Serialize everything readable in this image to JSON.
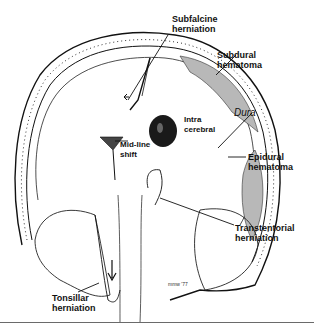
{
  "figure": {
    "labels": {
      "subfalcine": "Subfalcine\nherniation",
      "subdural": "Subdural\nhematoma",
      "dura": "Dura",
      "intracerebral": "Intra\ncerebral",
      "midline": "Mid-line\nshift",
      "epidural": "Epidural\nhematoma",
      "transtentorial": "Transtentorial\nherniation",
      "tonsillar": "Tonsillar\nherniation"
    },
    "artist_signature": "mmw '77"
  },
  "colors": {
    "ink": "#111111",
    "hematoma_gray": "#b8b8b8",
    "clot_dark": "#1a1a1a",
    "rule": "#6a6a6a"
  }
}
